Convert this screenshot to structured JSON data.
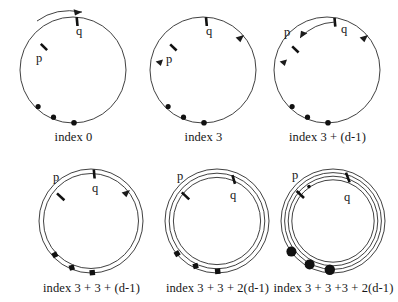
{
  "figure": {
    "type": "diagram",
    "pointer_labels": {
      "p": "p",
      "q": "q"
    },
    "panels": [
      {
        "id": "panel-1",
        "caption": "index 0",
        "rings": 1,
        "pointer_p_deg": 112,
        "pointer_q_deg": 86,
        "dot_count": 3,
        "dot_size": "small",
        "has_outside_arrow": true,
        "has_inner_arc": false,
        "ring_arrowheads": 0
      },
      {
        "id": "panel-2",
        "caption": "index 3",
        "rings": 1,
        "pointer_p_deg": 113,
        "pointer_q_deg": 88,
        "dot_count": 3,
        "dot_size": "small",
        "has_outside_arrow": false,
        "has_inner_arc": false,
        "ring_arrowheads": 2
      },
      {
        "id": "panel-3",
        "caption": "index 3 + (d-1)",
        "rings": 1,
        "pointer_p_deg": 118,
        "pointer_q_deg": 83,
        "dot_count": 3,
        "dot_size": "small",
        "has_outside_arrow": false,
        "has_inner_arc": true,
        "ring_arrowheads": 2
      },
      {
        "id": "panel-4",
        "caption": "index 3 + 3 + (d-1)",
        "rings": 2,
        "pointer_p_deg": 114,
        "pointer_q_deg": 88,
        "dot_count": 3,
        "dot_size": "square",
        "has_outside_arrow": false,
        "has_inner_arc": false,
        "ring_arrowheads": 1
      },
      {
        "id": "panel-5",
        "caption": "index 3 + 3 + 2(d-1)",
        "rings": 3,
        "pointer_p_deg": 117,
        "pointer_q_deg": 70,
        "dot_count": 3,
        "dot_size": "square",
        "has_outside_arrow": false,
        "has_inner_arc": false,
        "ring_arrowheads": 0
      },
      {
        "id": "panel-6",
        "caption": "index 3 + 3 +3 + 2(d-1)",
        "rings": 4,
        "pointer_p_deg": 118,
        "pointer_q_deg": 72,
        "dot_count": 3,
        "dot_size": "large",
        "has_outside_arrow": false,
        "has_inner_arc": false,
        "ring_arrowheads": 0
      }
    ],
    "colors": {
      "stroke": "#2b2b2b",
      "marker": "#111111",
      "text": "#161616",
      "background": "#ffffff"
    }
  }
}
